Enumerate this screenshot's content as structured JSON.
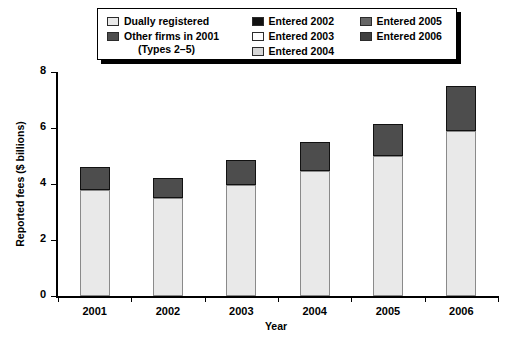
{
  "chart_data": {
    "type": "bar",
    "stacked": true,
    "title": "",
    "xlabel": "Year",
    "ylabel": "Reported fees ($ billions)",
    "categories": [
      "2001",
      "2002",
      "2003",
      "2004",
      "2005",
      "2006"
    ],
    "ylim": [
      0,
      8
    ],
    "yticks": [
      0,
      2,
      4,
      6,
      8
    ],
    "grid": false,
    "legend_position": "top",
    "series": [
      {
        "name": "Dually registered",
        "color": "#e9e9e9",
        "values": [
          3.8,
          3.5,
          3.95,
          4.45,
          5.0,
          5.9
        ]
      },
      {
        "name": "Other firms in 2001",
        "sublabel": "(Types 2–5)",
        "color": "#4d4d4d",
        "values": [
          0.8,
          0.7,
          0.0,
          0.0,
          0.0,
          0.0
        ]
      },
      {
        "name": "Entered 2002",
        "color": "#111111",
        "values": [
          0.0,
          0.0,
          0.0,
          0.0,
          0.0,
          0.0
        ]
      },
      {
        "name": "Entered 2003",
        "color": "#fdfdfd",
        "values": [
          0.0,
          0.0,
          0.9,
          0.0,
          0.0,
          0.0
        ]
      },
      {
        "name": "Entered 2004",
        "color": "#d6d6d6",
        "values": [
          0.0,
          0.0,
          0.0,
          1.05,
          0.0,
          0.0
        ]
      },
      {
        "name": "Entered 2005",
        "color": "#666666",
        "values": [
          0.0,
          0.0,
          0.0,
          0.0,
          1.15,
          0.0
        ]
      },
      {
        "name": "Entered 2006",
        "color": "#3f3f3f",
        "values": [
          0.0,
          0.0,
          0.0,
          0.0,
          0.0,
          1.6
        ]
      }
    ],
    "totals": [
      4.6,
      4.2,
      4.85,
      5.5,
      6.15,
      7.5
    ],
    "bars": [
      {
        "category": "2001",
        "total": "4.60",
        "segments": [
          {
            "series": "Dually registered",
            "value": 3.8,
            "color": "#e9e9e9"
          },
          {
            "series": "Other firms in 2001",
            "value": 0.8,
            "color": "#4d4d4d"
          }
        ]
      },
      {
        "category": "2002",
        "total": "4.20",
        "segments": [
          {
            "series": "Dually registered",
            "value": 3.5,
            "color": "#e9e9e9"
          },
          {
            "series": "Other firms in 2001",
            "value": 0.7,
            "color": "#4d4d4d"
          }
        ]
      },
      {
        "category": "2003",
        "total": "4.85",
        "segments": [
          {
            "series": "Dually registered",
            "value": 3.95,
            "color": "#e9e9e9"
          },
          {
            "series": "Other firms in 2001",
            "value": 0.9,
            "color": "#4d4d4d"
          }
        ]
      },
      {
        "category": "2004",
        "total": "5.50",
        "segments": [
          {
            "series": "Dually registered",
            "value": 4.45,
            "color": "#e9e9e9"
          },
          {
            "series": "Other firms in 2001",
            "value": 1.05,
            "color": "#4d4d4d"
          }
        ]
      },
      {
        "category": "2005",
        "total": "6.15",
        "segments": [
          {
            "series": "Dually registered",
            "value": 5.0,
            "color": "#e9e9e9"
          },
          {
            "series": "Other firms in 2001",
            "value": 1.15,
            "color": "#4d4d4d"
          }
        ]
      },
      {
        "category": "2006",
        "total": "7.50",
        "segments": [
          {
            "series": "Dually registered",
            "value": 5.9,
            "color": "#e9e9e9"
          },
          {
            "series": "Other firms in 2001",
            "value": 1.6,
            "color": "#4d4d4d"
          }
        ]
      }
    ]
  },
  "legend": {
    "columns": [
      {
        "items": [
          {
            "label": "Dually registered",
            "color": "#e9e9e9",
            "sublabel": ""
          },
          {
            "label": "Other firms in 2001",
            "color": "#4d4d4d",
            "sublabel": "(Types 2–5)"
          }
        ]
      },
      {
        "items": [
          {
            "label": "Entered 2002",
            "color": "#111111",
            "sublabel": ""
          },
          {
            "label": "Entered 2003",
            "color": "#fdfdfd",
            "sublabel": ""
          },
          {
            "label": "Entered 2004",
            "color": "#d6d6d6",
            "sublabel": ""
          }
        ]
      },
      {
        "items": [
          {
            "label": "Entered 2005",
            "color": "#666666",
            "sublabel": ""
          },
          {
            "label": "Entered 2006",
            "color": "#3f3f3f",
            "sublabel": ""
          }
        ]
      }
    ]
  },
  "axes": {
    "y_title": "Reported fees ($ billions)",
    "x_title": "Year",
    "y_tick_labels": [
      "0",
      "2",
      "4",
      "6",
      "8"
    ],
    "x_tick_labels": [
      "2001",
      "2002",
      "2003",
      "2004",
      "2005",
      "2006"
    ]
  }
}
